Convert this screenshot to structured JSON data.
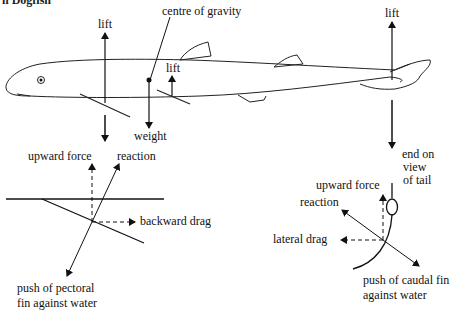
{
  "header": {
    "partial_title": "n   Dogfish"
  },
  "fish_view": {
    "labels": {
      "lift_pectoral": "lift",
      "centre_of_gravity": "centre of gravity",
      "lift_pelvic": "lift",
      "weight": "weight",
      "lift_tail": "lift"
    }
  },
  "pectoral_detail": {
    "labels": {
      "upward_force": "upward force",
      "reaction": "reaction",
      "backward_drag": "backward drag",
      "push_line1": "push of pectoral",
      "push_line2": "fin against water"
    }
  },
  "tail_detail": {
    "labels": {
      "end_on_1": "end on",
      "end_on_2": "view",
      "end_on_3": "of tail",
      "upward_force": "upward force",
      "reaction": "reaction",
      "lateral_drag": "lateral drag",
      "push_line1": "push of caudal fin",
      "push_line2": "against water"
    }
  }
}
